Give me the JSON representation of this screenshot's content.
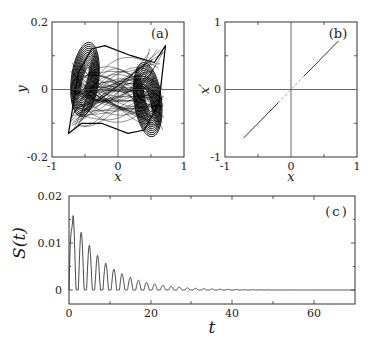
{
  "chart_data": [
    {
      "id": "a",
      "type": "scatter",
      "panel_label": "(a)",
      "title": "",
      "xlabel": "x",
      "ylabel": "y",
      "xlim": [
        -1,
        1
      ],
      "ylim": [
        -0.2,
        0.2
      ],
      "xticks": [
        "-1",
        "0",
        "1"
      ],
      "yticks": [
        "-0.2",
        "0",
        "0.2"
      ],
      "grid": false,
      "zero_lines": true,
      "description": "Chaotic double-scroll attractor trajectory; lobes centered near x=-0.5 and x=0.45, spanning x in [-0.75, 0.72], y in [-0.13, 0.13]",
      "extent": {
        "xmin": -0.75,
        "xmax": 0.72,
        "ymin": -0.13,
        "ymax": 0.13
      },
      "color": "#000000"
    },
    {
      "id": "b",
      "type": "line",
      "panel_label": "(b)",
      "title": "",
      "xlabel": "x",
      "ylabel": "x′",
      "xlim": [
        -1,
        1
      ],
      "ylim": [
        -1,
        1
      ],
      "xticks": [
        "-1",
        "0",
        "1"
      ],
      "yticks": [
        "-1",
        "0",
        "1"
      ],
      "grid": false,
      "zero_lines": true,
      "description": "Synchronization diagonal x′ = x",
      "x": [
        -0.72,
        0.72
      ],
      "y": [
        -0.72,
        0.72
      ],
      "color": "#333333"
    },
    {
      "id": "c",
      "type": "line",
      "panel_label": "(c)",
      "title": "",
      "xlabel": "t",
      "ylabel": "S(t)",
      "xlim": [
        0,
        70
      ],
      "ylim": [
        -0.003,
        0.02
      ],
      "xticks": [
        "0",
        "20",
        "40",
        "60"
      ],
      "yticks": [
        "0",
        "0.01",
        "0.02"
      ],
      "grid": false,
      "description": "Damped oscillation decaying to zero; peaks shrink from ~0.016 near t=1 to ~0 by t~35",
      "peaks_t": [
        1,
        3,
        5,
        7,
        9,
        11,
        13,
        15,
        17,
        19,
        21,
        23,
        25,
        27,
        29,
        31
      ],
      "peaks_S": [
        0.016,
        0.0117,
        0.0092,
        0.007,
        0.0052,
        0.004,
        0.003,
        0.0022,
        0.0016,
        0.0011,
        0.0008,
        0.0005,
        0.0004,
        0.0003,
        0.0002,
        0.0001
      ],
      "troughs_t": [
        2.2,
        4.2,
        6.2,
        8.2,
        10.2,
        12.2,
        14.2,
        16.2,
        18.2,
        20.2
      ],
      "troughs_S": [
        0.0018,
        0.0016,
        0.0012,
        0.0006,
        0.0006,
        0.0005,
        0.0004,
        0.0003,
        0.0002,
        0.0001
      ],
      "color": "#333333"
    }
  ],
  "labels": {
    "a": {
      "panel": "(a)",
      "x": "x",
      "y": "y",
      "xt": [
        "-1",
        "0",
        "1"
      ],
      "yt": [
        "-0.2",
        "0",
        "0.2"
      ]
    },
    "b": {
      "panel": "(b)",
      "x": "x",
      "y": "x′",
      "xt": [
        "-1",
        "0",
        "1"
      ],
      "yt": [
        "-1",
        "0",
        "1"
      ]
    },
    "c": {
      "panel": "(c)",
      "x": "t",
      "y": "S(t)",
      "xt": [
        "0",
        "20",
        "40",
        "60"
      ],
      "yt": [
        "0",
        "0.01",
        "0.02"
      ]
    }
  }
}
